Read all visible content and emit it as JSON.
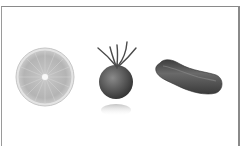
{
  "image": {
    "description": "Grayscale photograph of three produce items on white background inside a thin frame",
    "items": [
      {
        "name": "citrus-slice",
        "label": "Citrus slice"
      },
      {
        "name": "tomato",
        "label": "Tomato"
      },
      {
        "name": "cucumber",
        "label": "Cucumber"
      }
    ]
  },
  "colors": {
    "background": "#ffffff",
    "frame": "#8a8a8a",
    "citrus_rind": "#d8d8d8",
    "citrus_flesh": "#b8b8b8",
    "tomato": "#5e5e5e",
    "cucumber": "#545454"
  }
}
